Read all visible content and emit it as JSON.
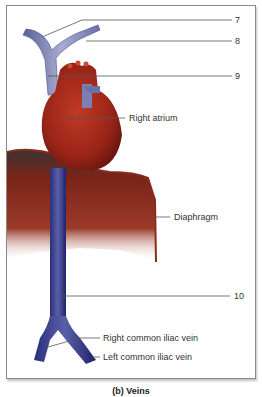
{
  "figure": {
    "caption": "(b) Veins",
    "labels": {
      "l7": "7",
      "l8": "8",
      "l9": "9",
      "right_atrium": "Right atrium",
      "diaphragm": "Diaphragm",
      "l10": "10",
      "right_common_iliac": "Right common iliac vein",
      "left_common_iliac": "Left common iliac vein"
    },
    "colors": {
      "vein_blue": "#3a3f8f",
      "vein_light": "#8a90c0",
      "heart_red": "#a82a1e",
      "diaphragm_red": "#8e2a1c",
      "leader_line": "#555555"
    }
  }
}
